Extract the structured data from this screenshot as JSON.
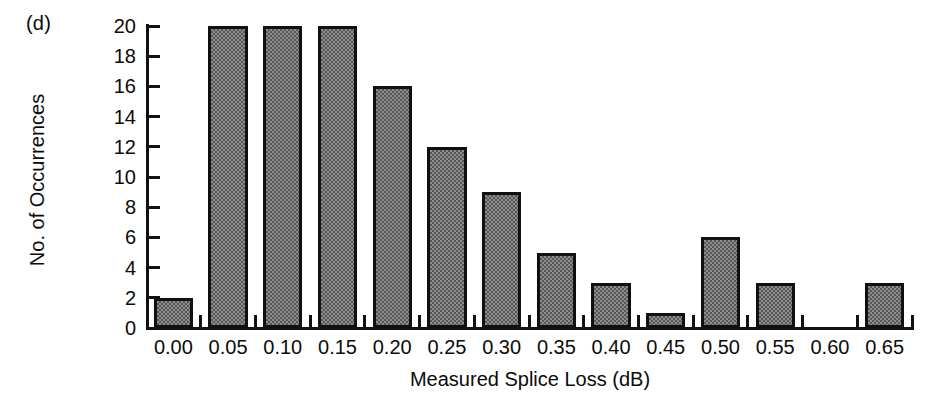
{
  "panel": {
    "label": "(d)"
  },
  "chart_data": {
    "type": "bar",
    "title": "",
    "xlabel": "Measured Splice Loss (dB)",
    "ylabel": "No. of Occurrences",
    "categories": [
      "0.00",
      "0.05",
      "0.10",
      "0.15",
      "0.20",
      "0.25",
      "0.30",
      "0.35",
      "0.40",
      "0.45",
      "0.50",
      "0.55",
      "0.60",
      "0.65"
    ],
    "values": [
      2,
      20,
      20,
      20,
      16,
      12,
      9,
      5,
      3,
      1,
      6,
      3,
      0,
      3
    ],
    "ylim": [
      0,
      20
    ],
    "ytick_labels": [
      "0",
      "2",
      "4",
      "6",
      "8",
      "10",
      "12",
      "14",
      "16",
      "18",
      "20"
    ],
    "ytick_values": [
      0,
      2,
      4,
      6,
      8,
      10,
      12,
      14,
      16,
      18,
      20
    ],
    "xtick_labels": [
      "0.00",
      "0.05",
      "0.10",
      "0.15",
      "0.20",
      "0.25",
      "0.30",
      "0.35",
      "0.40",
      "0.45",
      "0.50",
      "0.55",
      "0.60",
      "0.65"
    ],
    "grid": false,
    "legend": null,
    "bar_fill_color": "#8d8d8d",
    "bar_edge_color": "#111111",
    "axis_color": "#111111",
    "background_color": "#ffffff"
  }
}
